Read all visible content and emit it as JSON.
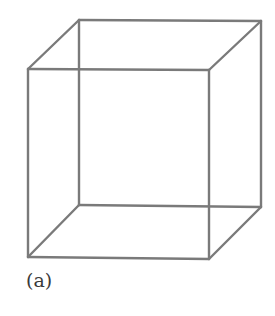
{
  "figure": {
    "caption": "(a)",
    "type": "necker-cube-wireframe",
    "line_color": "#7a7a7a",
    "line_width": 2.4,
    "vertices": {
      "front_top_left": [
        28,
        69
      ],
      "front_top_right": [
        209,
        70
      ],
      "front_bottom_left": [
        28,
        257
      ],
      "front_bottom_right": [
        209,
        259
      ],
      "back_top_left": [
        79,
        20
      ],
      "back_top_right": [
        261,
        21
      ],
      "back_bottom_left": [
        79,
        205
      ],
      "back_bottom_right": [
        261,
        207
      ]
    }
  }
}
